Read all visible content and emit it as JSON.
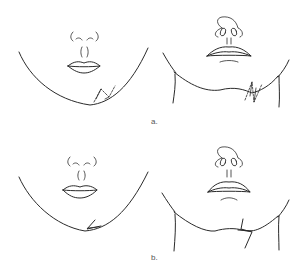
{
  "figure": {
    "panels": [
      {
        "id": "a",
        "label": "a.",
        "description": "Chin and submental views with planned Z-plasty incisions (dashed) across the scar line",
        "views": [
          "frontal-chin",
          "submental-neck"
        ]
      },
      {
        "id": "b",
        "label": "b.",
        "description": "Chin and submental views after Z-plasty flap transposition",
        "views": [
          "frontal-chin",
          "submental-neck"
        ]
      }
    ],
    "colors": {
      "ink": "#2a2a2a",
      "label": "#555555",
      "background": "#ffffff"
    }
  }
}
